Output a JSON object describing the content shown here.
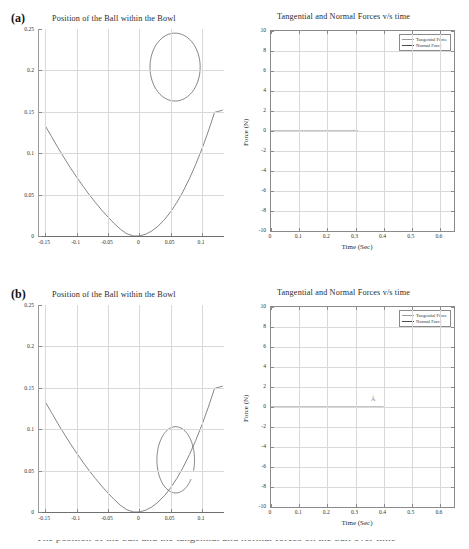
{
  "figure": {
    "caption_partial": "The position of the ball and the tangential and normal forces on the ball over time"
  },
  "panels": [
    {
      "tag": "(a)",
      "left_chart": {
        "title": "Position of the Ball within the Bowl",
        "xlabel": "",
        "ylabel": "",
        "xticks": [
          "-0.15",
          "-0.1",
          "-0.05",
          "0",
          "0.05",
          "0.1"
        ],
        "yticks": [
          "0.25",
          "0.2",
          "0.15",
          "0.1",
          "0.05",
          "0"
        ]
      },
      "right_chart": {
        "title": "Tangential and Normal Forces v/s time",
        "xlabel": "Time (Sec)",
        "ylabel": "Force (N)",
        "xticks": [
          "0",
          "0.1",
          "0.2",
          "0.3",
          "0.4",
          "0.5",
          "0.6"
        ],
        "yticks": [
          "10",
          "8",
          "6",
          "4",
          "2",
          "0",
          "-2",
          "-4",
          "-6",
          "-8",
          "-10"
        ],
        "legend": [
          "Tangential Force",
          "Normal Force"
        ]
      }
    },
    {
      "tag": "(b)",
      "left_chart": {
        "title": "Position of the Ball within the Bowl",
        "xlabel": "",
        "ylabel": "",
        "xticks": [
          "-0.15",
          "-0.1",
          "-0.05",
          "0",
          "0.05",
          "0.1"
        ],
        "yticks": [
          "0.25",
          "0.2",
          "0.15",
          "0.1",
          "0.05",
          "0"
        ]
      },
      "right_chart": {
        "title": "Tangential and Normal Forces v/s time",
        "xlabel": "Time (Sec)",
        "ylabel": "Force (N)",
        "xticks": [
          "0",
          "0.1",
          "0.2",
          "0.3",
          "0.4",
          "0.5",
          "0.6"
        ],
        "yticks": [
          "10",
          "8",
          "6",
          "4",
          "2",
          "0",
          "-2",
          "-4",
          "-6",
          "-8",
          "-10"
        ],
        "legend": [
          "Tangential Force",
          "Normal Force"
        ],
        "artifact_glyph": "Å"
      }
    }
  ],
  "chart_data": [
    {
      "id": "a-position",
      "type": "line",
      "title": "Position of the Ball within the Bowl",
      "xlabel": "",
      "ylabel": "",
      "xlim": [
        -0.16,
        0.135
      ],
      "ylim": [
        0,
        0.25
      ],
      "grid": true,
      "legend_position": "none",
      "series": [
        {
          "name": "Bowl profile",
          "comment": "Parabolic bowl cross-section y = k*(x+0.009)^2, rising to ~0.133 at x=-0.15 and ~0.152 at x=0.133",
          "x": [
            -0.15,
            -0.14,
            -0.13,
            -0.12,
            -0.11,
            -0.1,
            -0.09,
            -0.08,
            -0.07,
            -0.06,
            -0.05,
            -0.04,
            -0.03,
            -0.02,
            -0.009,
            0.0,
            0.01,
            0.02,
            0.03,
            0.04,
            0.05,
            0.06,
            0.07,
            0.08,
            0.09,
            0.1,
            0.11,
            0.12,
            0.133
          ],
          "y": [
            0.133,
            0.12,
            0.107,
            0.0945,
            0.0825,
            0.0712,
            0.0603,
            0.05,
            0.0404,
            0.0313,
            0.0229,
            0.0151,
            0.008,
            0.0027,
            0.0,
            0.0001,
            0.0021,
            0.0061,
            0.012,
            0.0197,
            0.0293,
            0.0408,
            0.0542,
            0.0695,
            0.0866,
            0.1056,
            0.1265,
            0.1493,
            0.152
          ]
        },
        {
          "name": "Ball outline",
          "comment": "Closed circular ball marker drawn near the top-right of the bowl, centred at (0.057, 0.204) with radius ~0.040 in x and ~0.041 in y",
          "center": [
            0.057,
            0.204
          ],
          "rx": 0.04,
          "ry": 0.041,
          "closed": true
        }
      ]
    },
    {
      "id": "a-forces",
      "type": "line",
      "title": "Tangential and Normal Forces v/s time",
      "xlabel": "Time (Sec)",
      "ylabel": "Force (N)",
      "xlim": [
        0,
        0.65
      ],
      "ylim": [
        -10,
        10
      ],
      "grid": true,
      "legend_position": "upper right",
      "series": [
        {
          "name": "Tangential Force",
          "x": [
            0,
            0.31
          ],
          "y": [
            0,
            0
          ]
        },
        {
          "name": "Normal Force",
          "x": [
            0,
            0.31
          ],
          "y": [
            0,
            0
          ]
        }
      ]
    },
    {
      "id": "b-position",
      "type": "line",
      "title": "Position of the Ball within the Bowl",
      "xlabel": "",
      "ylabel": "",
      "xlim": [
        -0.16,
        0.135
      ],
      "ylim": [
        0,
        0.25
      ],
      "grid": true,
      "legend_position": "none",
      "series": [
        {
          "name": "Bowl profile",
          "comment": "Same parabolic bowl cross-section as panel (a)",
          "x": [
            -0.15,
            -0.14,
            -0.13,
            -0.12,
            -0.11,
            -0.1,
            -0.09,
            -0.08,
            -0.07,
            -0.06,
            -0.05,
            -0.04,
            -0.03,
            -0.02,
            -0.009,
            0.0,
            0.01,
            0.02,
            0.03,
            0.04,
            0.05,
            0.06,
            0.07,
            0.08,
            0.09,
            0.1,
            0.11,
            0.12,
            0.133
          ],
          "y": [
            0.133,
            0.12,
            0.107,
            0.0945,
            0.0825,
            0.0712,
            0.0603,
            0.05,
            0.0404,
            0.0313,
            0.0229,
            0.0151,
            0.008,
            0.0027,
            0.0,
            0.0001,
            0.0021,
            0.0061,
            0.012,
            0.0197,
            0.0293,
            0.0408,
            0.0542,
            0.0695,
            0.0866,
            0.1056,
            0.1265,
            0.1493,
            0.152
          ]
        },
        {
          "name": "Ball outline",
          "comment": "Open (unclosed) ball outline resting inside the bowl, centred at (0.058, 0.063) with radius ~0.030 in x and ~0.040 in y; gap on the right side",
          "center": [
            0.058,
            0.063
          ],
          "rx": 0.03,
          "ry": 0.04,
          "closed": false
        }
      ]
    },
    {
      "id": "b-forces",
      "type": "line",
      "title": "Tangential and Normal Forces v/s time",
      "xlabel": "Time (Sec)",
      "ylabel": "Force (N)",
      "xlim": [
        0,
        0.65
      ],
      "ylim": [
        -10,
        10
      ],
      "grid": true,
      "legend_position": "upper right",
      "series": [
        {
          "name": "Tangential Force",
          "x": [
            0,
            0.4
          ],
          "y": [
            0,
            0
          ]
        },
        {
          "name": "Normal Force",
          "x": [
            0,
            0.4
          ],
          "y": [
            0,
            0
          ]
        }
      ]
    }
  ]
}
